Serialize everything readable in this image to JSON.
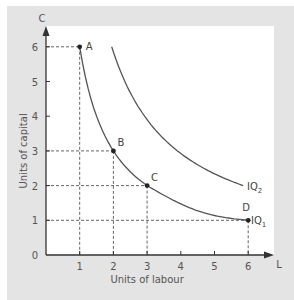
{
  "chart_data": {
    "type": "line",
    "title": "",
    "xlabel": "Units of labour",
    "ylabel": "Units of capital",
    "x_axis_end_label": "L",
    "y_axis_end_label": "C",
    "xlim": [
      0,
      6.5
    ],
    "ylim": [
      0,
      6.5
    ],
    "x_ticks": [
      "0",
      "1",
      "2",
      "3",
      "4",
      "5",
      "6"
    ],
    "y_ticks": [
      "0",
      "1",
      "2",
      "3",
      "4",
      "5",
      "6"
    ],
    "grid": false,
    "series": [
      {
        "name": "IQ1",
        "label": "IQ",
        "subscript": "1",
        "points": [
          {
            "label": "A",
            "x": 1,
            "y": 6
          },
          {
            "label": "B",
            "x": 2,
            "y": 3
          },
          {
            "label": "C",
            "x": 3,
            "y": 2
          },
          {
            "label": "D",
            "x": 6,
            "y": 1
          }
        ]
      },
      {
        "name": "IQ2",
        "label": "IQ",
        "subscript": "2",
        "x": [
          1.95,
          3,
          4,
          5,
          5.9
        ],
        "y": [
          6,
          3.9,
          2.9,
          2.3,
          2.0
        ]
      }
    ],
    "guide_lines": "dashed projections from A, B, C, D to both axes"
  },
  "colors": {
    "background_panel": "#e4e4e4",
    "plot_area": "#ffffff",
    "axis": "#333333",
    "curve": "#555555"
  }
}
